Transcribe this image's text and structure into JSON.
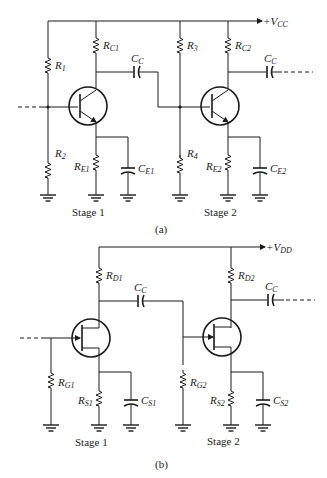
{
  "circuit_a": {
    "caption": "(a)",
    "supply": {
      "sign": "+",
      "main": "V",
      "sub": "CC"
    },
    "stage_labels": [
      "Stage 1",
      "Stage 2"
    ],
    "resistors": [
      {
        "main": "R",
        "sub": "1"
      },
      {
        "main": "R",
        "sub": "2"
      },
      {
        "main": "R",
        "sub": "C1"
      },
      {
        "main": "R",
        "sub": "E1"
      },
      {
        "main": "R",
        "sub": "3"
      },
      {
        "main": "R",
        "sub": "4"
      },
      {
        "main": "R",
        "sub": "C2"
      },
      {
        "main": "R",
        "sub": "E2"
      }
    ],
    "capacitors": [
      {
        "main": "C",
        "sub": "C"
      },
      {
        "main": "C",
        "sub": "E1"
      },
      {
        "main": "C",
        "sub": "C"
      },
      {
        "main": "C",
        "sub": "E2"
      }
    ],
    "transistor_type": "NPN BJT"
  },
  "circuit_b": {
    "caption": "(b)",
    "supply": {
      "sign": "+",
      "main": "V",
      "sub": "DD"
    },
    "stage_labels": [
      "Stage 1",
      "Stage 2"
    ],
    "resistors": [
      {
        "main": "R",
        "sub": "G1"
      },
      {
        "main": "R",
        "sub": "D1"
      },
      {
        "main": "R",
        "sub": "S1"
      },
      {
        "main": "R",
        "sub": "G2"
      },
      {
        "main": "R",
        "sub": "D2"
      },
      {
        "main": "R",
        "sub": "S2"
      }
    ],
    "capacitors": [
      {
        "main": "C",
        "sub": "C"
      },
      {
        "main": "C",
        "sub": "S1"
      },
      {
        "main": "C",
        "sub": "C"
      },
      {
        "main": "C",
        "sub": "S2"
      }
    ],
    "transistor_type": "N-channel JFET"
  }
}
